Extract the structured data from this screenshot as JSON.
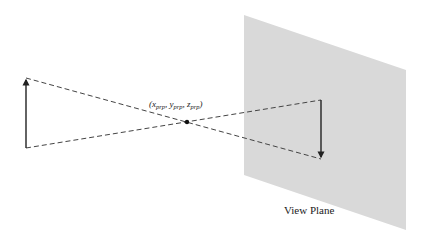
{
  "diagram": {
    "prp_label": {
      "open": "(",
      "x": "x",
      "x_sub": "prp",
      "y": "y",
      "y_sub": "prp",
      "z": "z",
      "z_sub": "prp",
      "sep": ", ",
      "close": ")"
    },
    "view_plane_label": "View Plane",
    "colors": {
      "plane_fill": "#d9d9d9",
      "line": "#333333",
      "dash": "#444444"
    },
    "geometry": {
      "plane": [
        [
          244,
          15
        ],
        [
          406,
          70
        ],
        [
          406,
          230
        ],
        [
          244,
          175
        ]
      ],
      "object_arrow": {
        "x": 26,
        "y_top": 78,
        "y_bottom": 148,
        "direction": "up"
      },
      "image_arrow": {
        "x": 321,
        "y_top": 100,
        "y_bottom": 159,
        "direction": "down"
      },
      "prp_point": [
        187,
        122
      ]
    }
  }
}
